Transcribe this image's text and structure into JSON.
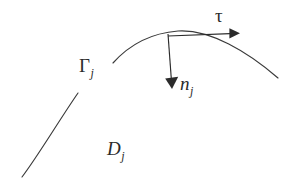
{
  "figure": {
    "width": 290,
    "height": 183,
    "background_color": "#ffffff",
    "ink_color": "#2b2b2b",
    "curve_color": "#3a3a3a"
  },
  "labels": {
    "gamma": {
      "symbol": "Γ",
      "subscript": "j",
      "x": 79,
      "y": 56
    },
    "normal": {
      "symbol": "n",
      "subscript": "j",
      "x": 180,
      "y": 74
    },
    "tangent": {
      "symbol": "τ",
      "subscript": "",
      "x": 215,
      "y": 6
    },
    "domain": {
      "symbol": "D",
      "subscript": "j",
      "x": 107,
      "y": 139
    }
  },
  "geometry": {
    "boundary_arc": {
      "name": "Gamma_j",
      "path": "M 113 63 C 130 44 152 33 178 31 C 210 29 248 52 278 78"
    },
    "lower_arc": {
      "name": "D_j boundary segment",
      "path": "M 22 177 C 38 156 58 122 78 93"
    },
    "normal_vector": {
      "name": "n_j",
      "origin_x": 168,
      "origin_y": 34,
      "tip_x": 172,
      "tip_y": 89,
      "line_path": "M 168 34 L 171.4 80",
      "head_points": "165.2,78.5 178.2,76.8 172,89"
    },
    "tangent_vector": {
      "name": "tau",
      "origin_x": 168,
      "origin_y": 36,
      "tip_x": 240,
      "tip_y": 33,
      "line_path": "M 168 36 L 230 33.6",
      "head_points": "229.4,28.2 240,33.2 229.4,38.6"
    }
  }
}
